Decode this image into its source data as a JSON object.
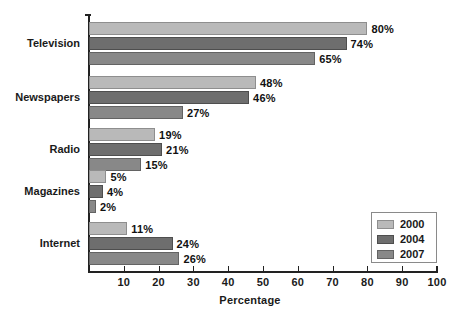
{
  "chart_data": {
    "type": "bar",
    "orientation": "horizontal",
    "title": "",
    "xlabel": "Percentage",
    "ylabel": "",
    "xlim": [
      0,
      100
    ],
    "xticks": [
      10,
      20,
      30,
      40,
      50,
      60,
      70,
      80,
      90,
      100
    ],
    "grid": false,
    "legend_position": "lower-right",
    "categories": [
      "Television",
      "Newspapers",
      "Radio",
      "Magazines",
      "Internet"
    ],
    "series": [
      {
        "name": "2000",
        "color": "#b9b9b9",
        "values": [
          80,
          48,
          19,
          5,
          11
        ]
      },
      {
        "name": "2004",
        "color": "#6e6e6e",
        "values": [
          74,
          46,
          21,
          4,
          24
        ]
      },
      {
        "name": "2007",
        "color": "#888888",
        "values": [
          65,
          27,
          15,
          2,
          26
        ]
      }
    ],
    "value_labels": [
      [
        "80%",
        "74%",
        "65%"
      ],
      [
        "48%",
        "46%",
        "27%"
      ],
      [
        "19%",
        "21%",
        "15%"
      ],
      [
        "5%",
        "4%",
        "2%"
      ],
      [
        "11%",
        "24%",
        "26%"
      ]
    ]
  }
}
